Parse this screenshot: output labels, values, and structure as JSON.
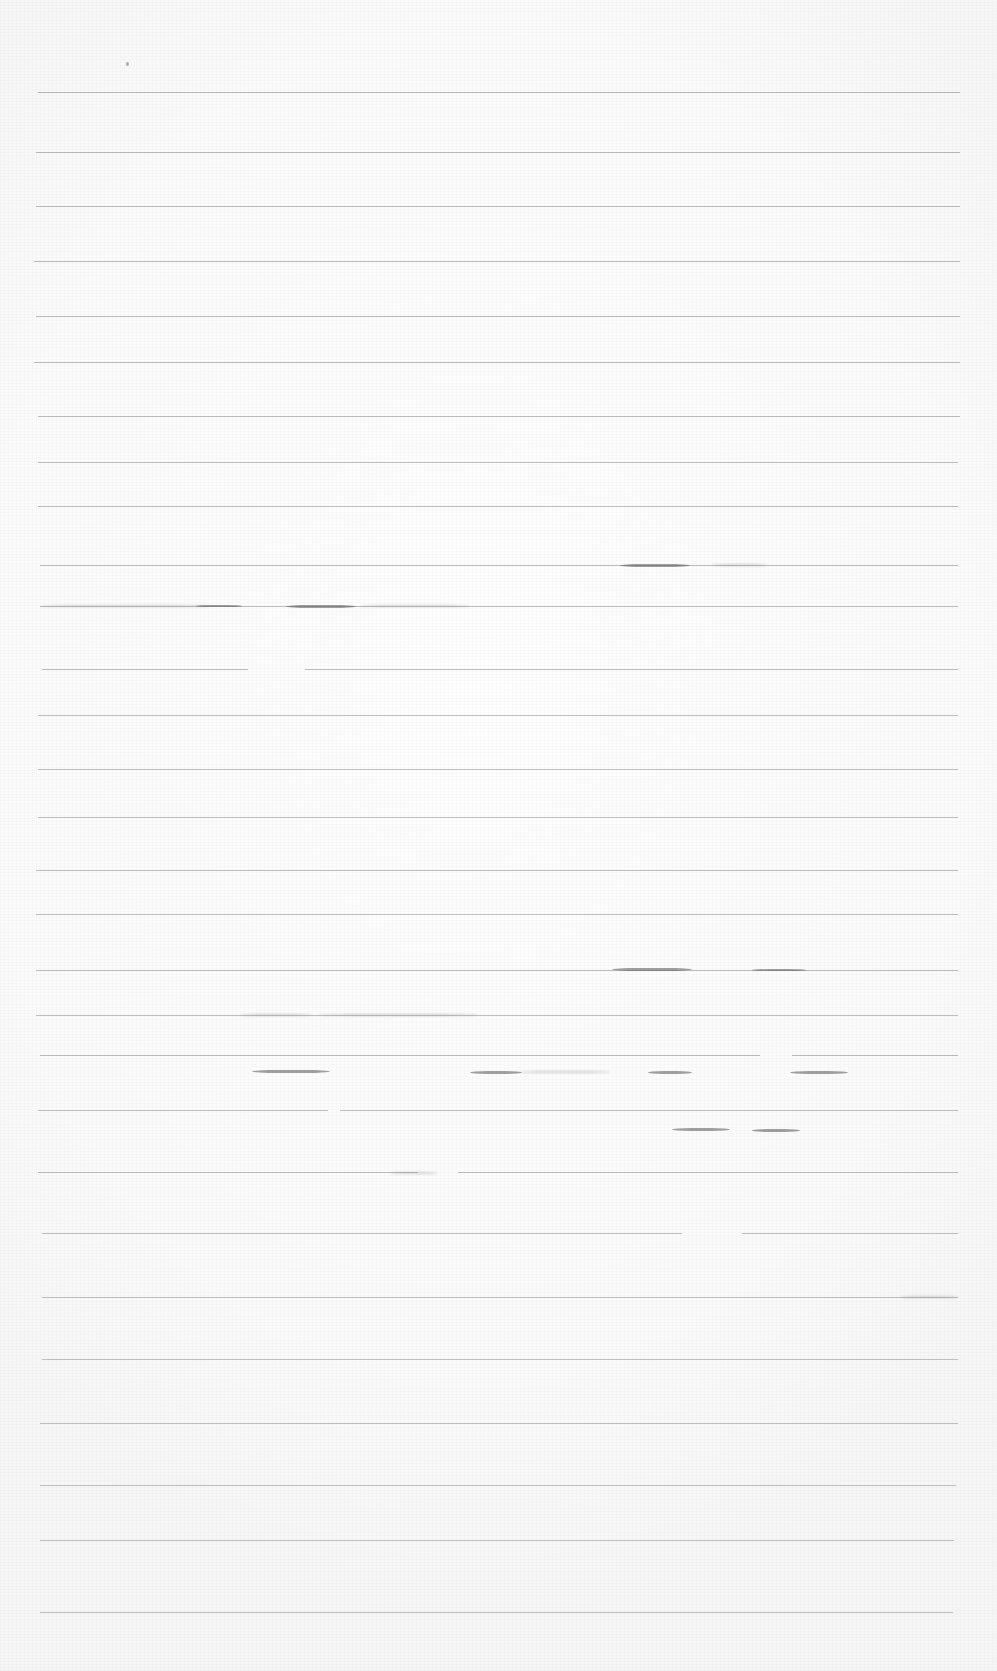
{
  "document": {
    "kind": "scanned-ruled-paper",
    "title": "",
    "visible_text": "",
    "page_width": 997,
    "page_height": 1671,
    "background_color": "#fefefe",
    "rule_color": "#8d8d92",
    "ink_color": "#6d6d73",
    "note": ""
  },
  "ruled_lines": [
    {
      "y": 92,
      "x": 38,
      "width": 922,
      "opacity": 0.6
    },
    {
      "y": 152,
      "x": 36,
      "width": 924,
      "opacity": 0.6
    },
    {
      "y": 206,
      "x": 36,
      "width": 924,
      "opacity": 0.58
    },
    {
      "y": 261,
      "x": 34,
      "width": 926,
      "opacity": 0.58
    },
    {
      "y": 316,
      "x": 36,
      "width": 924,
      "opacity": 0.58
    },
    {
      "y": 362,
      "x": 34,
      "width": 926,
      "opacity": 0.58
    },
    {
      "y": 416,
      "x": 38,
      "width": 922,
      "opacity": 0.56
    },
    {
      "y": 462,
      "x": 38,
      "width": 920,
      "opacity": 0.56
    },
    {
      "y": 506,
      "x": 38,
      "width": 920,
      "opacity": 0.56
    },
    {
      "y": 565,
      "x": 40,
      "width": 918,
      "opacity": 0.58
    },
    {
      "y": 606,
      "x": 40,
      "width": 918,
      "opacity": 0.56
    },
    {
      "y": 669,
      "x": 42,
      "width": 206,
      "opacity": 0.56
    },
    {
      "y": 669,
      "x": 305,
      "width": 653,
      "opacity": 0.56
    },
    {
      "y": 715,
      "x": 38,
      "width": 920,
      "opacity": 0.54
    },
    {
      "y": 769,
      "x": 38,
      "width": 920,
      "opacity": 0.54
    },
    {
      "y": 817,
      "x": 38,
      "width": 920,
      "opacity": 0.54
    },
    {
      "y": 870,
      "x": 36,
      "width": 922,
      "opacity": 0.56
    },
    {
      "y": 914,
      "x": 36,
      "width": 922,
      "opacity": 0.54
    },
    {
      "y": 970,
      "x": 36,
      "width": 922,
      "opacity": 0.56
    },
    {
      "y": 1015,
      "x": 36,
      "width": 922,
      "opacity": 0.54
    },
    {
      "y": 1055,
      "x": 40,
      "width": 720,
      "opacity": 0.56
    },
    {
      "y": 1055,
      "x": 792,
      "width": 166,
      "opacity": 0.56
    },
    {
      "y": 1110,
      "x": 38,
      "width": 290,
      "opacity": 0.54
    },
    {
      "y": 1110,
      "x": 340,
      "width": 618,
      "opacity": 0.54
    },
    {
      "y": 1172,
      "x": 38,
      "width": 380,
      "opacity": 0.56
    },
    {
      "y": 1172,
      "x": 458,
      "width": 500,
      "opacity": 0.56
    },
    {
      "y": 1233,
      "x": 42,
      "width": 640,
      "opacity": 0.54
    },
    {
      "y": 1233,
      "x": 742,
      "width": 216,
      "opacity": 0.54
    },
    {
      "y": 1297,
      "x": 42,
      "width": 916,
      "opacity": 0.54
    },
    {
      "y": 1359,
      "x": 42,
      "width": 916,
      "opacity": 0.52
    },
    {
      "y": 1423,
      "x": 40,
      "width": 918,
      "opacity": 0.54
    },
    {
      "y": 1485,
      "x": 40,
      "width": 916,
      "opacity": 0.52
    },
    {
      "y": 1540,
      "x": 40,
      "width": 914,
      "opacity": 0.52
    },
    {
      "y": 1612,
      "x": 40,
      "width": 913,
      "opacity": 0.52
    }
  ],
  "ink_marks": [
    {
      "x": 620,
      "y": 564,
      "width": 70,
      "height": 3,
      "tone": "dark"
    },
    {
      "x": 712,
      "y": 564,
      "width": 55,
      "height": 2,
      "tone": "soft"
    },
    {
      "x": 40,
      "y": 605,
      "width": 170,
      "height": 2,
      "tone": "soft"
    },
    {
      "x": 196,
      "y": 605,
      "width": 46,
      "height": 2,
      "tone": "dark"
    },
    {
      "x": 286,
      "y": 605,
      "width": 70,
      "height": 3,
      "tone": "dark"
    },
    {
      "x": 360,
      "y": 605,
      "width": 110,
      "height": 2,
      "tone": "soft"
    },
    {
      "x": 612,
      "y": 968,
      "width": 80,
      "height": 3,
      "tone": "dark"
    },
    {
      "x": 752,
      "y": 969,
      "width": 54,
      "height": 2,
      "tone": "dark"
    },
    {
      "x": 240,
      "y": 1014,
      "width": 72,
      "height": 2,
      "tone": "soft"
    },
    {
      "x": 318,
      "y": 1014,
      "width": 160,
      "height": 2,
      "tone": "soft"
    },
    {
      "x": 252,
      "y": 1070,
      "width": 78,
      "height": 3,
      "tone": "dark"
    },
    {
      "x": 470,
      "y": 1071,
      "width": 52,
      "height": 3,
      "tone": "dark"
    },
    {
      "x": 520,
      "y": 1071,
      "width": 90,
      "height": 2,
      "tone": "soft"
    },
    {
      "x": 648,
      "y": 1071,
      "width": 44,
      "height": 3,
      "tone": "dark"
    },
    {
      "x": 790,
      "y": 1071,
      "width": 58,
      "height": 3,
      "tone": "dark"
    },
    {
      "x": 672,
      "y": 1128,
      "width": 58,
      "height": 3,
      "tone": "dark"
    },
    {
      "x": 752,
      "y": 1129,
      "width": 48,
      "height": 3,
      "tone": "dark"
    },
    {
      "x": 390,
      "y": 1172,
      "width": 48,
      "height": 2,
      "tone": "soft"
    },
    {
      "x": 900,
      "y": 1296,
      "width": 58,
      "height": 2,
      "tone": "soft"
    }
  ],
  "speck": {
    "x": 126,
    "y": 62,
    "label": ""
  }
}
